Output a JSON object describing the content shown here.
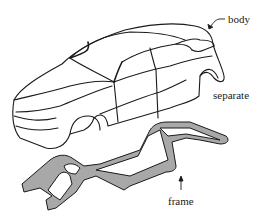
{
  "diagram": {
    "labels": {
      "body": "body",
      "separate": "separate",
      "frame": "frame"
    },
    "colors": {
      "background": "#ffffff",
      "outline": "#1a1a1a",
      "frame_fill": "#a8a8a8",
      "text": "#222222"
    },
    "components": [
      {
        "id": "body",
        "description": "car body shell, line drawing",
        "arrow_to": "roof rear"
      },
      {
        "id": "frame",
        "description": "ladder chassis frame, gray filled",
        "arrow_to": "frame right rail"
      }
    ]
  }
}
